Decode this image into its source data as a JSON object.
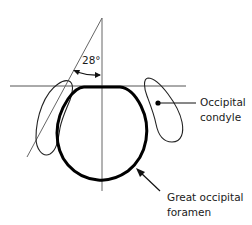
{
  "diagram": {
    "angle_label": "28°",
    "labels": {
      "condyle_line1": "Occipital",
      "condyle_line2": "condyle",
      "foramen_line1": "Great occipital",
      "foramen_line2": "foramen"
    },
    "colors": {
      "stroke": "#111111",
      "thin_line": "#555555",
      "background": "#ffffff"
    }
  }
}
